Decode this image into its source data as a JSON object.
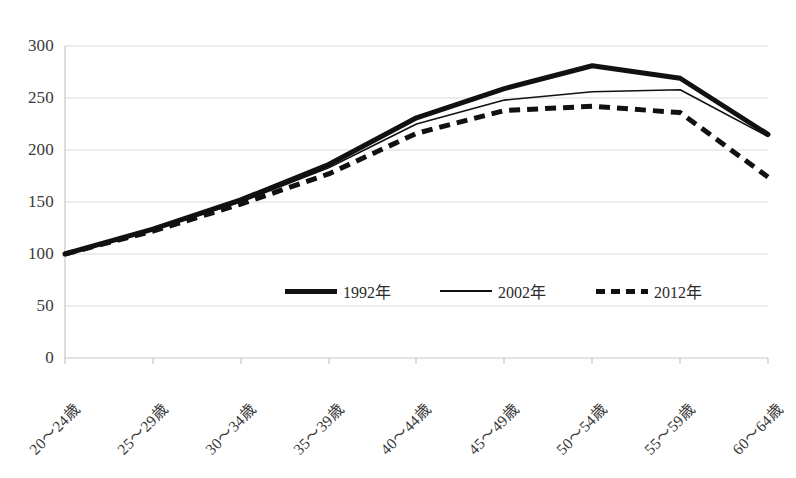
{
  "chart_data": {
    "type": "line",
    "title": "",
    "subtitle": "",
    "xlabel": "",
    "ylabel": "",
    "categories": [
      "20～24歳",
      "25～29歳",
      "30～34歳",
      "35～39歳",
      "40～44歳",
      "45～49歳",
      "50～54歳",
      "55～59歳",
      "60～64歳"
    ],
    "ylim": [
      0,
      300
    ],
    "yticks": [
      0,
      50,
      100,
      150,
      200,
      250,
      300
    ],
    "ytick_labels": [
      "0",
      "50",
      "100",
      "150",
      "200",
      "250",
      "300"
    ],
    "grid": true,
    "grid_axis": "y",
    "legend_position": "center-inside",
    "series": [
      {
        "name": "1992年",
        "style": "solid-thick",
        "color": "#111111",
        "values": [
          100,
          124,
          152,
          186,
          231,
          259,
          281,
          269,
          215
        ]
      },
      {
        "name": "2002年",
        "style": "solid-thin",
        "color": "#111111",
        "values": [
          100,
          123,
          150,
          183,
          225,
          248,
          256,
          258,
          213
        ]
      },
      {
        "name": "2012年",
        "style": "dashed-thick",
        "color": "#111111",
        "values": [
          100,
          122,
          148,
          177,
          216,
          238,
          242,
          236,
          174
        ]
      }
    ]
  },
  "legend": {
    "items": [
      {
        "label": "1992年",
        "style": "solid-thick"
      },
      {
        "label": "2002年",
        "style": "solid-thin"
      },
      {
        "label": "2012年",
        "style": "dashed-thick"
      }
    ]
  },
  "axis": {
    "y_labels": [
      "300",
      "250",
      "200",
      "150",
      "100",
      "50",
      "0"
    ],
    "x_labels": [
      "20～24歳",
      "25～29歳",
      "30～34歳",
      "35～39歳",
      "40～44歳",
      "45～49歳",
      "50～54歳",
      "55～59歳",
      "60～64歳"
    ]
  },
  "colors": {
    "gridline": "#d9d9d9",
    "axis": "#bfbfbf",
    "series": "#111111",
    "text": "#3a3a3a",
    "background": "#ffffff"
  }
}
